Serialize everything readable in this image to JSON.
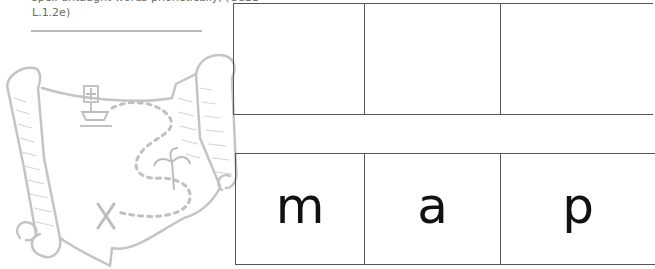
{
  "header": {
    "cut_line": "spell untaught words phonetically, (CCSS",
    "standard_tail": "L.1.2e)"
  },
  "illustration": {
    "icon": "treasure-map-scroll-icon",
    "color": "#c8c8c8"
  },
  "top_row": {
    "boxes": [
      "",
      "",
      ""
    ]
  },
  "bottom_row": {
    "boxes": [
      "m",
      "a",
      "p"
    ]
  },
  "colors": {
    "border": "#555555",
    "letter": "#111111",
    "rule": "#b9b9b9",
    "text": "#6a6a6a"
  }
}
